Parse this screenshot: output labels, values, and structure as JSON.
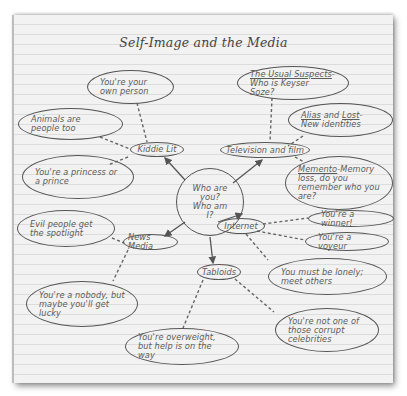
{
  "title": "Self-Image and the Media",
  "center": {
    "line1": "Who are you?",
    "line2": "Who am I?"
  },
  "categories": {
    "kiddie_lit": "Kiddie Lit",
    "television_film": "Television and film",
    "news_media": "News Media",
    "internet": "Internet",
    "tabloids": "Tabloids"
  },
  "messages": {
    "own_person": "You're your own person",
    "animals": "Animals are people too",
    "princess": "You're a princess or a prince",
    "usual_suspects_title": "The Usual Suspects",
    "usual_suspects_rest": "-Who is Keyser Soze?",
    "alias_title": "Alias",
    "alias_and": " and ",
    "lost_title": "Lost",
    "alias_rest": "-New identities",
    "memento_title": "Memento",
    "memento_rest": "-Memory loss, do you remember who you are?",
    "evil": "Evil people get the spotlight",
    "nobody": "You're a nobody, but maybe you'll get lucky",
    "winner": "You're a winner!",
    "voyeur": "You're a voyeur",
    "lonely": "You must be lonely; meet others",
    "overweight": "You're overweight, but help is on the way",
    "corrupt": "You're not one of those corrupt celebrities"
  },
  "colors": {
    "paper": "#f2f2f2",
    "rule_line": "#dcdcdc",
    "ink": "#555555",
    "text": "#5a5a5a"
  }
}
